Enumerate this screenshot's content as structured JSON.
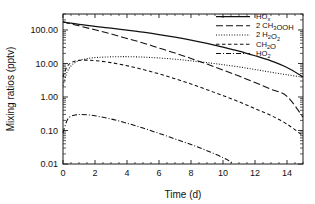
{
  "chart_data": {
    "type": "line",
    "title": "",
    "xlabel": "Time (d)",
    "ylabel": "Mixing ratios (pptv)",
    "xlim": [
      0,
      15
    ],
    "ylim": [
      0.01,
      300
    ],
    "yscale": "log",
    "xscale": "linear",
    "grid": false,
    "legend_position": "top-right",
    "xticks": [
      0,
      2,
      4,
      6,
      8,
      10,
      12,
      14
    ],
    "xticklabels": [
      "0",
      "2",
      "4",
      "6",
      "8",
      "10",
      "12",
      "14"
    ],
    "yticks": [
      0.01,
      0.1,
      1.0,
      10.0,
      100.0
    ],
    "yticklabels": [
      "0.01",
      "0.10",
      "1.00",
      "10.00",
      "100.00"
    ],
    "series": [
      {
        "name": "HOx",
        "label_main": "HO",
        "label_sub": "x",
        "linestyle": "solid",
        "dasharray": "",
        "color": "#111111",
        "x": [
          0,
          0.5,
          1,
          1.5,
          2,
          3,
          4,
          5,
          6,
          7,
          8,
          9,
          10,
          11,
          12,
          13,
          14,
          15
        ],
        "y": [
          175,
          160,
          148,
          138,
          129,
          113,
          99,
          86,
          73,
          61,
          50,
          40,
          31,
          23.5,
          17,
          12,
          7.6,
          4.0
        ]
      },
      {
        "name": "2 CH3OOH",
        "label_main": "2 CH",
        "label_sub": "3",
        "label_tail": "OOH",
        "linestyle": "long-dash",
        "dasharray": "7,3",
        "color": "#111111",
        "x": [
          0,
          0.5,
          1,
          2,
          3,
          4,
          5,
          6,
          7,
          8,
          9,
          10,
          11,
          12,
          13,
          14,
          15
        ],
        "y": [
          175,
          152,
          133,
          101,
          76,
          56,
          41,
          29,
          20.5,
          14.2,
          9.6,
          6.4,
          4.2,
          2.7,
          1.7,
          1.05,
          0.25
        ]
      },
      {
        "name": "2 H2O2",
        "label_main": "2 H",
        "label_sub": "2",
        "label_tail": "O",
        "label_sub2": "2",
        "linestyle": "dotted",
        "dasharray": "1,1.6",
        "color": "#111111",
        "x": [
          0,
          0.25,
          0.5,
          0.75,
          1,
          1.5,
          2,
          2.5,
          3,
          3.5,
          4,
          5,
          6,
          7,
          8,
          9,
          10,
          11,
          12,
          13,
          14,
          15
        ],
        "y": [
          2.2,
          5.5,
          8.5,
          10.6,
          12.2,
          14.0,
          15.0,
          15.5,
          15.8,
          16.0,
          16.0,
          15.5,
          14.6,
          13.4,
          12.0,
          10.6,
          9.2,
          7.9,
          6.6,
          5.5,
          4.6,
          3.9
        ]
      },
      {
        "name": "CH2O",
        "label_main": "CH",
        "label_sub": "2",
        "label_tail": "O",
        "linestyle": "dashed",
        "dasharray": "3.5,2.5",
        "color": "#111111",
        "x": [
          0,
          0.25,
          0.5,
          0.75,
          1,
          1.5,
          2,
          3,
          4,
          5,
          6,
          7,
          8,
          9,
          10,
          11,
          12,
          13,
          14,
          15
        ],
        "y": [
          4.0,
          8.0,
          10.5,
          11.8,
          12.4,
          12.6,
          12.2,
          10.6,
          8.6,
          6.6,
          4.9,
          3.5,
          2.45,
          1.65,
          1.1,
          0.72,
          0.45,
          0.28,
          0.155,
          0.07
        ]
      },
      {
        "name": "HO2",
        "label_main": "HO",
        "label_sub": "2",
        "linestyle": "dash-dot",
        "dasharray": "5,2,1,2",
        "color": "#111111",
        "x": [
          0,
          0.25,
          0.5,
          0.75,
          1,
          1.5,
          2,
          3,
          4,
          5,
          6,
          7,
          8,
          9,
          10,
          10.6
        ],
        "y": [
          0.085,
          0.2,
          0.265,
          0.29,
          0.3,
          0.295,
          0.275,
          0.22,
          0.165,
          0.118,
          0.082,
          0.056,
          0.038,
          0.025,
          0.0155,
          0.0108
        ]
      }
    ]
  },
  "legend": {
    "entries": [
      {
        "text": "HOx"
      },
      {
        "text": "2 CH3OOH"
      },
      {
        "text": "2 H2O2"
      },
      {
        "text": "CH2O"
      },
      {
        "text": "HO2"
      }
    ]
  }
}
